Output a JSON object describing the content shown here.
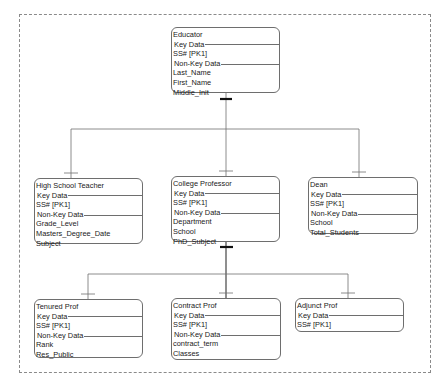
{
  "diagram": {
    "type": "entity-relationship (supertype/subtype hierarchy)",
    "caption": "",
    "colors": {
      "line": "#6e6e6e",
      "frame": "#8a8a8a",
      "text": "#1a1a1a",
      "background": "#ffffff"
    },
    "entities": {
      "educator": {
        "name": "Educator",
        "key_label": "Key Data",
        "keys": [
          "SS#  [PK1]"
        ],
        "nonkey_label": "Non-Key Data",
        "attributes": [
          "Last_Name",
          "First_Name",
          "Middle_Init"
        ]
      },
      "high_school_teacher": {
        "name": "High School Teacher",
        "key_label": "Key Data",
        "keys": [
          "SS#  [PK1]"
        ],
        "nonkey_label": "Non-Key Data",
        "attributes": [
          "Grade_Level",
          "Masters_Degree_Date",
          "Subject"
        ]
      },
      "college_professor": {
        "name": "College Professor",
        "key_label": "Key Data",
        "keys": [
          "SS#  [PK1]"
        ],
        "nonkey_label": "Non-Key Data",
        "attributes": [
          "Department",
          "School",
          "PhD_Subject"
        ]
      },
      "dean": {
        "name": "Dean",
        "key_label": "Key Data",
        "keys": [
          "SS#  [PK1]"
        ],
        "nonkey_label": "Non-Key Data",
        "attributes": [
          "School",
          "Total_Students"
        ]
      },
      "tenured_prof": {
        "name": "Tenured Prof",
        "key_label": "Key Data",
        "keys": [
          "SS#  [PK1]"
        ],
        "nonkey_label": "Non-Key Data",
        "attributes": [
          "Rank",
          "Res_Public"
        ]
      },
      "contract_prof": {
        "name": "Contract Prof",
        "key_label": "Key Data",
        "keys": [
          "SS#  [PK1]"
        ],
        "nonkey_label": "Non-Key Data",
        "attributes": [
          "contract_term",
          "Classes"
        ]
      },
      "adjunct_prof": {
        "name": "Adjunct Prof",
        "key_label": "Key Data",
        "keys": [
          "SS#  [PK1]"
        ]
      }
    },
    "relationships": [
      {
        "parent": "Educator",
        "children": [
          "High School Teacher",
          "College Professor",
          "Dean"
        ],
        "notation": "subtype (one-to-one, optional)"
      },
      {
        "parent": "College Professor",
        "children": [
          "Tenured Prof",
          "Contract Prof",
          "Adjunct Prof"
        ],
        "notation": "subtype (one-to-one, optional)"
      }
    ]
  }
}
